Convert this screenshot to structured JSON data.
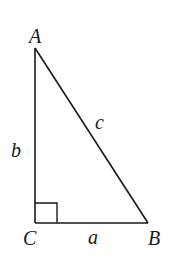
{
  "diagram": {
    "type": "right-triangle",
    "vertices": {
      "A": {
        "label": "A",
        "x": 35,
        "y": 48
      },
      "B": {
        "label": "B",
        "x": 148,
        "y": 223
      },
      "C": {
        "label": "C",
        "x": 35,
        "y": 223
      }
    },
    "sides": {
      "a": {
        "label": "a",
        "between": "C-B"
      },
      "b": {
        "label": "b",
        "between": "A-C"
      },
      "c": {
        "label": "c",
        "between": "A-B"
      }
    },
    "right_angle_at": "C",
    "stroke_color": "#1a1a1a",
    "background": "#ffffff"
  }
}
